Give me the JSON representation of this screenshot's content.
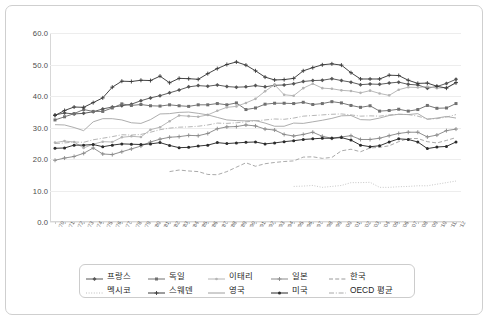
{
  "chart_data": {
    "type": "line",
    "title": "",
    "xlabel": "",
    "ylabel": "",
    "ylim": [
      0.0,
      60.0
    ],
    "ytick_labels": [
      "60.0",
      "50.0",
      "40.0",
      "30.0",
      "20.0",
      "10.0",
      "0.0"
    ],
    "ytick_values": [
      60.0,
      50.0,
      40.0,
      30.0,
      20.0,
      10.0,
      0.0
    ],
    "grid": true,
    "legend_position": "bottom",
    "categories": [
      "'70",
      "'71",
      "'72",
      "'73",
      "'74",
      "'75",
      "'76",
      "'77",
      "'78",
      "'79",
      "'80",
      "'81",
      "'82",
      "'83",
      "'84",
      "'85",
      "'86",
      "'87",
      "'88",
      "'89",
      "'90",
      "'91",
      "'92",
      "'93",
      "'94",
      "'95",
      "'96",
      "'97",
      "'98",
      "'99",
      "'00",
      "'01",
      "'02",
      "'03",
      "'04",
      "'05",
      "'06",
      "'07",
      "'08",
      "'09",
      "'10",
      "'11",
      "'12"
    ],
    "series": [
      {
        "name": "프랑스",
        "color": "#555555",
        "dash": "none",
        "marker": "diamond",
        "values": [
          34.0,
          34.6,
          34.3,
          34.5,
          35.0,
          35.9,
          36.5,
          36.9,
          37.4,
          38.5,
          39.4,
          40.1,
          41.0,
          41.9,
          42.9,
          43.3,
          43.1,
          43.5,
          43.0,
          42.8,
          42.9,
          43.3,
          42.9,
          43.4,
          43.5,
          43.9,
          44.6,
          44.9,
          45.0,
          45.5,
          44.9,
          44.4,
          43.6,
          43.8,
          43.7,
          44.1,
          44.4,
          43.7,
          43.5,
          42.5,
          43.0,
          44.0,
          45.3
        ]
      },
      {
        "name": "독일",
        "color": "#707070",
        "dash": "none",
        "marker": "square",
        "values": [
          32.4,
          33.4,
          34.4,
          35.7,
          35.1,
          35.1,
          36.2,
          37.5,
          37.0,
          37.3,
          36.9,
          36.8,
          37.2,
          36.9,
          36.7,
          37.2,
          37.2,
          37.6,
          37.2,
          37.8,
          35.7,
          36.2,
          37.4,
          37.7,
          37.7,
          37.6,
          38.0,
          37.3,
          37.6,
          38.2,
          37.8,
          37.0,
          36.4,
          36.9,
          35.2,
          35.4,
          35.8,
          35.2,
          35.7,
          37.0,
          36.1,
          36.2,
          37.6
        ]
      },
      {
        "name": "이태리",
        "color": "#b4b4b4",
        "dash": "none",
        "marker": "dot",
        "values": [
          25.2,
          25.7,
          25.4,
          23.5,
          24.7,
          25.5,
          25.4,
          26.9,
          27.2,
          27.0,
          29.3,
          30.1,
          32.0,
          33.8,
          33.6,
          33.4,
          34.0,
          35.3,
          36.4,
          36.7,
          37.8,
          39.1,
          41.5,
          43.6,
          40.4,
          40.1,
          42.5,
          43.9,
          42.5,
          42.3,
          41.8,
          41.6,
          41.0,
          41.7,
          40.8,
          40.2,
          42.0,
          42.8,
          42.7,
          43.0,
          42.5,
          42.7,
          44.0
        ]
      },
      {
        "name": "일본",
        "color": "#8a8a8a",
        "dash": "none",
        "marker": "cross",
        "values": [
          19.6,
          20.3,
          20.8,
          21.8,
          23.5,
          21.6,
          21.4,
          22.3,
          23.2,
          24.1,
          25.4,
          26.3,
          26.9,
          27.1,
          27.5,
          27.4,
          28.1,
          29.6,
          30.2,
          30.3,
          30.8,
          30.5,
          29.5,
          29.2,
          27.8,
          27.3,
          27.8,
          28.5,
          27.2,
          26.6,
          27.0,
          27.4,
          26.2,
          26.2,
          26.6,
          27.4,
          28.1,
          28.5,
          28.5,
          27.0,
          27.6,
          29.0,
          29.5
        ]
      },
      {
        "name": "한국",
        "color": "#9a9a9a",
        "dash": "dashed",
        "marker": "none",
        "values": [
          null,
          null,
          null,
          null,
          null,
          null,
          null,
          null,
          null,
          null,
          null,
          null,
          16.0,
          16.5,
          16.2,
          16.0,
          15.1,
          15.0,
          16.0,
          17.4,
          18.8,
          17.7,
          18.5,
          18.9,
          19.2,
          19.4,
          20.6,
          20.7,
          20.2,
          20.5,
          22.6,
          23.1,
          22.3,
          23.5,
          23.7,
          24.2,
          25.5,
          26.5,
          26.5,
          25.5,
          25.1,
          25.9,
          26.8
        ]
      },
      {
        "name": "멕시코",
        "color": "#bdbdbd",
        "dash": "dotted",
        "marker": "none",
        "values": [
          null,
          null,
          null,
          null,
          null,
          null,
          null,
          null,
          null,
          null,
          null,
          null,
          null,
          null,
          null,
          null,
          null,
          null,
          null,
          null,
          null,
          null,
          null,
          null,
          null,
          11.3,
          11.4,
          11.6,
          11.0,
          11.3,
          11.6,
          12.5,
          12.5,
          12.6,
          11.0,
          11.0,
          11.2,
          11.3,
          11.5,
          11.5,
          12.0,
          12.5,
          13.0
        ]
      },
      {
        "name": "스웨덴",
        "color": "#3a3a3a",
        "dash": "none",
        "marker": "plus",
        "values": [
          33.8,
          35.4,
          36.5,
          36.4,
          37.9,
          39.4,
          42.8,
          44.7,
          44.6,
          45.0,
          44.9,
          46.3,
          44.2,
          45.6,
          45.5,
          45.3,
          47.1,
          48.7,
          50.0,
          50.8,
          49.8,
          48.0,
          46.0,
          45.1,
          45.2,
          45.6,
          48.0,
          49.0,
          49.9,
          50.2,
          49.8,
          47.4,
          45.4,
          45.4,
          45.4,
          46.6,
          46.5,
          45.0,
          44.0,
          44.1,
          43.1,
          42.5,
          44.3
        ]
      },
      {
        "name": "영국",
        "color": "#9e9e9e",
        "dash": "none",
        "marker": "none",
        "values": [
          30.9,
          30.8,
          30.0,
          29.0,
          31.8,
          32.8,
          32.8,
          32.4,
          31.5,
          31.3,
          32.5,
          34.3,
          34.4,
          34.8,
          34.9,
          34.5,
          34.0,
          33.2,
          32.4,
          32.2,
          32.1,
          32.2,
          31.4,
          30.4,
          30.4,
          31.4,
          31.3,
          31.8,
          32.3,
          32.9,
          33.7,
          33.8,
          32.5,
          32.4,
          33.0,
          33.8,
          34.2,
          34.1,
          34.4,
          32.6,
          33.0,
          33.5,
          33.0
        ]
      },
      {
        "name": "미국",
        "color": "#2b2b2b",
        "dash": "none",
        "marker": "filled-dot",
        "values": [
          23.4,
          23.5,
          24.4,
          24.4,
          24.6,
          23.9,
          24.4,
          24.8,
          24.7,
          24.6,
          24.8,
          25.2,
          24.3,
          23.6,
          23.7,
          24.1,
          24.4,
          25.2,
          24.9,
          25.1,
          25.3,
          25.4,
          24.8,
          25.1,
          25.5,
          25.8,
          26.2,
          26.4,
          26.6,
          26.6,
          26.8,
          26.0,
          24.4,
          23.9,
          24.2,
          25.4,
          26.4,
          26.2,
          25.4,
          23.3,
          23.8,
          24.0,
          25.4
        ]
      },
      {
        "name": "OECD 평균",
        "color": "#a8a8a8",
        "dash": "dash-dot",
        "marker": "none",
        "values": [
          24.9,
          25.1,
          25.4,
          25.3,
          26.1,
          26.6,
          27.1,
          27.7,
          27.6,
          27.8,
          28.5,
          29.3,
          29.8,
          30.1,
          30.2,
          30.4,
          30.8,
          31.4,
          31.3,
          31.5,
          31.8,
          32.1,
          32.4,
          32.7,
          32.6,
          33.0,
          33.6,
          33.8,
          34.0,
          34.2,
          34.3,
          34.0,
          33.6,
          33.7,
          33.6,
          34.0,
          34.2,
          34.1,
          33.6,
          32.7,
          32.8,
          33.3,
          34.1
        ]
      }
    ]
  },
  "legend": {
    "rows": [
      [
        "프랑스",
        "독일",
        "이태리",
        "일본",
        "한국"
      ],
      [
        "멕시코",
        "스웨덴",
        "영국",
        "미국",
        "OECD 평균"
      ]
    ]
  }
}
